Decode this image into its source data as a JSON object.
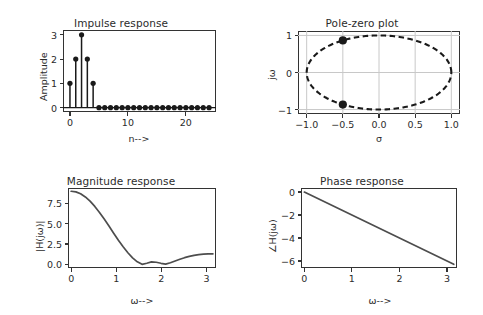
{
  "figure": {
    "background_color": "#ffffff",
    "line_color": "#4d4d4d",
    "marker_color": "#1a1a1a",
    "frame_color": "#333333",
    "grid_color": "#c8c8c8"
  },
  "panels": [
    {
      "id": "impulse-response",
      "title": "Impulse response",
      "xlabel": "n-->",
      "ylabel": "Amplitude",
      "xticks": [
        "0",
        "10",
        "20"
      ],
      "yticks": [
        "0",
        "1",
        "2",
        "3"
      ]
    },
    {
      "id": "pole-zero-plot",
      "title": "Pole-zero plot",
      "xlabel": "σ",
      "ylabel": "jω",
      "xticks": [
        "−1.0",
        "−0.5",
        "0.0",
        "0.5",
        "1.0"
      ],
      "yticks": [
        "−1",
        "0",
        "1"
      ]
    },
    {
      "id": "magnitude-response",
      "title": "Magnitude response",
      "xlabel": "ω-->",
      "ylabel": "|H(jω)|",
      "xticks": [
        "0",
        "1",
        "2",
        "3"
      ],
      "yticks": [
        "0.0",
        "2.5",
        "5.0",
        "7.5"
      ]
    },
    {
      "id": "phase-response",
      "title": "Phase response",
      "xlabel": "ω-->",
      "ylabel": "∠H(jω)",
      "xticks": [
        "0",
        "1",
        "2",
        "3"
      ],
      "yticks": [
        "−6",
        "−4",
        "−2",
        "0"
      ]
    }
  ],
  "chart_data": [
    {
      "type": "bar",
      "id": "impulse-response",
      "title": "Impulse response",
      "xlabel": "n-->",
      "ylabel": "Amplitude",
      "style": "stem",
      "xlim": [
        -1.2,
        25.2
      ],
      "ylim": [
        -0.18,
        3.2
      ],
      "xticks": [
        0,
        10,
        20
      ],
      "yticks": [
        0,
        1,
        2,
        3
      ],
      "grid": false,
      "x": [
        0,
        1,
        2,
        3,
        4,
        5,
        6,
        7,
        8,
        9,
        10,
        11,
        12,
        13,
        14,
        15,
        16,
        17,
        18,
        19,
        20,
        21,
        22,
        23,
        24
      ],
      "values": [
        1,
        2,
        3,
        2,
        1,
        0,
        0,
        0,
        0,
        0,
        0,
        0,
        0,
        0,
        0,
        0,
        0,
        0,
        0,
        0,
        0,
        0,
        0,
        0,
        0
      ]
    },
    {
      "type": "scatter",
      "id": "pole-zero-plot",
      "title": "Pole-zero plot",
      "xlabel": "σ",
      "ylabel": "jω",
      "xlim": [
        -1.12,
        1.12
      ],
      "ylim": [
        -1.12,
        1.12
      ],
      "xticks": [
        -1.0,
        -0.5,
        0.0,
        0.5,
        1.0
      ],
      "yticks": [
        -1,
        0,
        1
      ],
      "grid": true,
      "unit_circle": {
        "radius": 1.0,
        "center": [
          0,
          0
        ],
        "dashed": true
      },
      "series": [
        {
          "name": "zeros",
          "marker": "o",
          "points": [
            [
              -0.5,
              0.866
            ],
            [
              -0.5,
              -0.866
            ]
          ]
        }
      ]
    },
    {
      "type": "line",
      "id": "magnitude-response",
      "title": "Magnitude response",
      "xlabel": "ω-->",
      "ylabel": "|H(jω)|",
      "xlim": [
        -0.07,
        3.21
      ],
      "ylim": [
        -0.45,
        9.4
      ],
      "xticks": [
        0,
        1,
        2,
        3
      ],
      "yticks": [
        0.0,
        2.5,
        5.0,
        7.5
      ],
      "grid": false,
      "x": [
        0.0,
        0.105,
        0.209,
        0.314,
        0.419,
        0.524,
        0.628,
        0.733,
        0.838,
        0.942,
        1.047,
        1.152,
        1.257,
        1.361,
        1.466,
        1.571,
        1.676,
        1.78,
        1.885,
        1.99,
        2.094,
        2.199,
        2.304,
        2.409,
        2.513,
        2.618,
        2.723,
        2.827,
        2.932,
        3.037,
        3.142
      ],
      "values": [
        9.0,
        8.92,
        8.69,
        8.3,
        7.78,
        7.13,
        6.39,
        5.57,
        4.71,
        3.83,
        2.97,
        2.16,
        1.43,
        0.8,
        0.31,
        0.0,
        0.14,
        0.3,
        0.26,
        0.13,
        0.03,
        0.19,
        0.41,
        0.63,
        0.82,
        0.98,
        1.11,
        1.2,
        1.26,
        1.29,
        1.3
      ]
    },
    {
      "type": "line",
      "id": "phase-response",
      "title": "Phase response",
      "xlabel": "ω-->",
      "ylabel": "∠H(jω)",
      "xlim": [
        -0.07,
        3.21
      ],
      "ylim": [
        -6.6,
        0.35
      ],
      "xticks": [
        0,
        1,
        2,
        3
      ],
      "yticks": [
        -6,
        -4,
        -2,
        0
      ],
      "grid": false,
      "x": [
        0.0,
        3.142
      ],
      "values": [
        0.0,
        -6.283
      ],
      "slope": -2.0
    }
  ]
}
